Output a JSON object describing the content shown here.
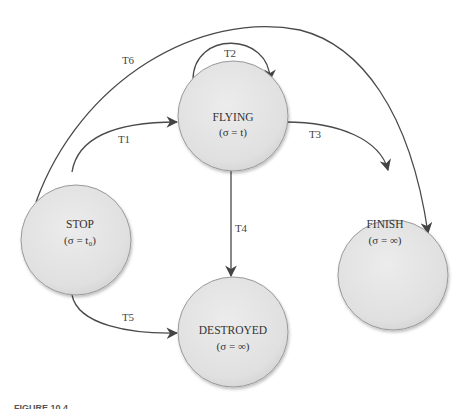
{
  "diagram": {
    "type": "state-machine",
    "states": [
      {
        "id": "stop",
        "name": "STOP",
        "sigma": "(σ = t₀)",
        "cx": 76,
        "cy": 240,
        "r": 55
      },
      {
        "id": "flying",
        "name": "FLYING",
        "sigma": "(σ = t)",
        "cx": 233,
        "cy": 116,
        "r": 55
      },
      {
        "id": "finish",
        "name": "FINISH",
        "sigma": "(σ = ∞)",
        "cx": 393,
        "cy": 275,
        "r": 55
      },
      {
        "id": "destroyed",
        "name": "DESTROYED",
        "sigma": "(σ = ∞)",
        "cx": 233,
        "cy": 332,
        "r": 55
      }
    ],
    "transitions": [
      {
        "id": "T1",
        "label": "T1",
        "from": "STOP",
        "to": "FLYING"
      },
      {
        "id": "T2",
        "label": "T2",
        "from": "FLYING",
        "to": "FLYING"
      },
      {
        "id": "T3",
        "label": "T3",
        "from": "FLYING",
        "to": "FINISH"
      },
      {
        "id": "T4",
        "label": "T4",
        "from": "FLYING",
        "to": "DESTROYED"
      },
      {
        "id": "T5",
        "label": "T5",
        "from": "STOP",
        "to": "DESTROYED"
      },
      {
        "id": "T6",
        "label": "T6",
        "from": "STOP",
        "to": "FINISH"
      }
    ],
    "colors": {
      "state_fill": "#e4e4e4",
      "state_stroke": "#9a9a9a",
      "edge": "#4a4a4a",
      "text": "#333333"
    }
  },
  "caption": {
    "text": "FIGURE 10.4"
  }
}
